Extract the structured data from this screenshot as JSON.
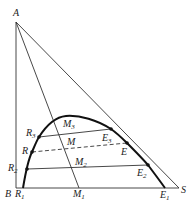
{
  "diagram": {
    "type": "ternary-extraction-diagram",
    "vertices": {
      "A": {
        "label": "A",
        "x": 16,
        "y": 22
      },
      "B": {
        "label": "B",
        "x": 16,
        "y": 188
      },
      "S": {
        "label": "S",
        "x": 179,
        "y": 188
      }
    },
    "binodal_curve": {
      "points": [
        [
          23,
          188
        ],
        [
          27,
          169
        ],
        [
          32,
          152
        ],
        [
          39,
          137
        ],
        [
          50,
          124
        ],
        [
          65,
          116
        ],
        [
          82,
          117
        ],
        [
          97,
          121
        ],
        [
          111,
          129
        ],
        [
          127,
          143
        ],
        [
          148,
          165
        ],
        [
          165,
          188
        ]
      ]
    },
    "points": {
      "R1": {
        "label": "R",
        "sub": "1",
        "x": 23,
        "y": 188
      },
      "R2": {
        "label": "R",
        "sub": "2",
        "x": 27,
        "y": 169
      },
      "R": {
        "label": "R",
        "sub": "",
        "x": 32,
        "y": 152
      },
      "R3": {
        "label": "R",
        "sub": "3",
        "x": 39,
        "y": 137
      },
      "M1": {
        "label": "M",
        "sub": "1",
        "x": 79,
        "y": 188
      },
      "M2": {
        "label": "M",
        "sub": "2",
        "x": 75,
        "y": 169
      },
      "M": {
        "label": "M",
        "sub": "",
        "x": 71,
        "y": 146
      },
      "M3": {
        "label": "M",
        "sub": "3",
        "x": 63,
        "y": 117
      },
      "E1": {
        "label": "E",
        "sub": "1",
        "x": 165,
        "y": 188
      },
      "E2": {
        "label": "E",
        "sub": "2",
        "x": 148,
        "y": 165
      },
      "E": {
        "label": "E",
        "sub": "",
        "x": 127,
        "y": 143
      },
      "E3": {
        "label": "E",
        "sub": "3",
        "x": 111,
        "y": 129
      }
    },
    "tie_lines": [
      {
        "from": "R3",
        "to": "E3",
        "style": "solid"
      },
      {
        "from": "R",
        "to": "E",
        "style": "dashed"
      },
      {
        "from": "R2",
        "to": "E2",
        "style": "solid"
      },
      {
        "from": "R1",
        "to": "E1",
        "style": "solid"
      }
    ],
    "construction_lines": [
      {
        "from": "A",
        "to": "M1"
      },
      {
        "from": "A",
        "to": "S"
      },
      {
        "from": "A",
        "to": "B"
      },
      {
        "from": "B",
        "to": "S"
      }
    ],
    "labels": {
      "A": "A",
      "B": "B",
      "S": "S",
      "R": "R",
      "M": "M",
      "E": "E",
      "sub1": "1",
      "sub2": "2",
      "sub3": "3"
    }
  }
}
